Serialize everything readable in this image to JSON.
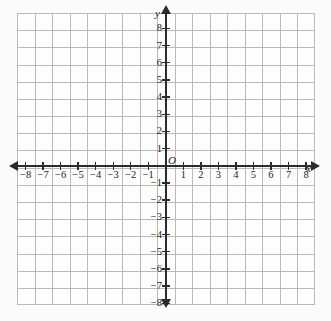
{
  "figure": {
    "kind": "cartesian-coordinate-grid",
    "origin_label": "O",
    "x_axis_name": "x",
    "y_axis_name": "y",
    "background_color": "#fbfbfb",
    "grid_color": "#b9b9b9",
    "axis_color": "#2b2b2b"
  },
  "axes": {
    "x": {
      "min": -8.5,
      "max": 8.5,
      "step": 1,
      "negative_labels": [
        "−8",
        "−7",
        "−6",
        "−5",
        "−4",
        "−3",
        "−2",
        "−1"
      ],
      "negative_values": [
        -8,
        -7,
        -6,
        -5,
        -4,
        -3,
        -2,
        -1
      ],
      "positive_labels": [
        "1",
        "2",
        "3",
        "4",
        "5",
        "6",
        "7",
        "8"
      ],
      "positive_values": [
        1,
        2,
        3,
        4,
        5,
        6,
        7,
        8
      ]
    },
    "y": {
      "min": -8.5,
      "max": 8.5,
      "step": 1,
      "positive_labels": [
        "8",
        "7",
        "6",
        "5",
        "4",
        "3",
        "2",
        "1"
      ],
      "positive_values": [
        8,
        7,
        6,
        5,
        4,
        3,
        2,
        1
      ],
      "negative_labels": [
        "−1",
        "−2",
        "−3",
        "−4",
        "−5",
        "−6",
        "−7",
        "−8"
      ],
      "negative_values": [
        -1,
        -2,
        -3,
        -4,
        -5,
        -6,
        -7,
        -8
      ]
    }
  },
  "chart_data": {
    "type": "scatter",
    "title": "",
    "subtitle": "",
    "xlabel": "x",
    "ylabel": "y",
    "xlim": [
      -8.5,
      8.5
    ],
    "ylim": [
      -8.5,
      8.5
    ],
    "xticks": [
      -8,
      -7,
      -6,
      -5,
      -4,
      -3,
      -2,
      -1,
      1,
      2,
      3,
      4,
      5,
      6,
      7,
      8
    ],
    "yticks": [
      -8,
      -7,
      -6,
      -5,
      -4,
      -3,
      -2,
      -1,
      1,
      2,
      3,
      4,
      5,
      6,
      7,
      8
    ],
    "grid": true,
    "legend": null,
    "series": [],
    "annotations": [
      "O"
    ]
  }
}
